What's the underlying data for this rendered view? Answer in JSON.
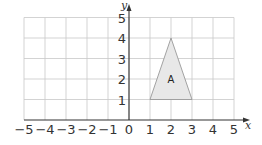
{
  "chart_data": {
    "type": "scatter",
    "title": "",
    "xlabel": "x",
    "ylabel": "y",
    "xlim": [
      -5,
      5
    ],
    "ylim": [
      0,
      5
    ],
    "grid": true,
    "x_ticks": [
      "-5",
      "-4",
      "-3",
      "-2",
      "-1",
      "0",
      "1",
      "2",
      "3",
      "4",
      "5"
    ],
    "y_ticks": [
      "1",
      "2",
      "3",
      "4",
      "5"
    ],
    "shapes": [
      {
        "name": "A",
        "type": "triangle",
        "vertices": [
          [
            1,
            1
          ],
          [
            2,
            4
          ],
          [
            3,
            1
          ]
        ],
        "fill": "#e8e8e8",
        "stroke": "#999999"
      }
    ]
  }
}
